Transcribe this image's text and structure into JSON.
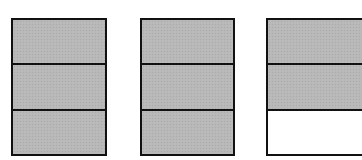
{
  "diagram": {
    "colors": {
      "filled": "#b8b8b8",
      "empty": "#ffffff",
      "border": "#111111"
    },
    "bars": [
      {
        "id": "bar-1",
        "parts": 3,
        "shaded": 3,
        "cells": [
          "filled",
          "filled",
          "filled"
        ]
      },
      {
        "id": "bar-2",
        "parts": 3,
        "shaded": 3,
        "cells": [
          "filled",
          "filled",
          "filled"
        ]
      },
      {
        "id": "bar-3",
        "parts": 3,
        "shaded": 2,
        "cells": [
          "filled",
          "filled",
          "empty"
        ]
      }
    ]
  }
}
